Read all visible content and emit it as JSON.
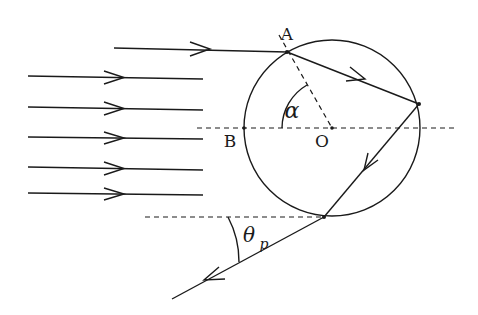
{
  "diagram": {
    "colors": {
      "stroke": "#1a1a1a",
      "background": "#ffffff"
    },
    "labels": {
      "point_a": "A",
      "point_b": "B",
      "center_o": "O",
      "angle_alpha": "α",
      "angle_theta": "θ",
      "angle_theta_sub": "p"
    },
    "circle": {
      "cx": 332,
      "cy": 128,
      "r": 88
    },
    "incident_rays": [
      {
        "y": 50,
        "x1": 114,
        "x2": 287,
        "arrow_x": 210
      },
      {
        "y": 77,
        "x1": 28,
        "x2": 203,
        "arrow_x": 124
      },
      {
        "y": 108,
        "x1": 28,
        "x2": 203,
        "arrow_x": 124
      },
      {
        "y": 138,
        "x1": 28,
        "x2": 203,
        "arrow_x": 124
      },
      {
        "y": 165,
        "x1": 28,
        "x2": 203,
        "arrow_x": 124
      },
      {
        "y": 192,
        "x1": 28,
        "x2": 203,
        "arrow_x": 124
      }
    ],
    "points": {
      "A": [
        287,
        52
      ],
      "B": [
        244,
        128
      ],
      "O": [
        332,
        128
      ],
      "reflection": [
        419,
        104
      ],
      "exit": [
        324,
        217
      ],
      "exit_ray_end": [
        172,
        299
      ]
    }
  }
}
